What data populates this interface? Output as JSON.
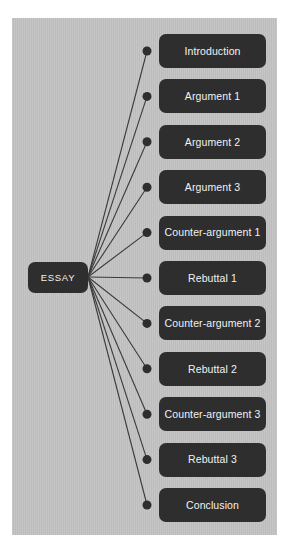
{
  "diagram": {
    "type": "mind-map",
    "background_color": "#c3c3c3",
    "node_color": "#2e2e2e",
    "node_text_color": "#f2f2f2",
    "edge_color": "#3a3a3a",
    "root": {
      "label": "ESSAY",
      "x": 28,
      "y": 262,
      "width": 60,
      "height": 31
    },
    "branch_geometry": {
      "box_x": 159,
      "box_width": 107,
      "box_height": 34,
      "first_box_y": 34,
      "vertical_spacing": 45.4,
      "dot_x": 147,
      "dot_radius": 4.5,
      "edge_origin_x": 88,
      "edge_origin_y": 277
    },
    "nodes": [
      {
        "label": "Introduction"
      },
      {
        "label": "Argument 1"
      },
      {
        "label": "Argument 2"
      },
      {
        "label": "Argument 3"
      },
      {
        "label": "Counter-argument 1"
      },
      {
        "label": "Rebuttal 1"
      },
      {
        "label": "Counter-argument 2"
      },
      {
        "label": "Rebuttal 2"
      },
      {
        "label": "Counter-argument 3"
      },
      {
        "label": "Rebuttal 3"
      },
      {
        "label": "Conclusion"
      }
    ]
  }
}
